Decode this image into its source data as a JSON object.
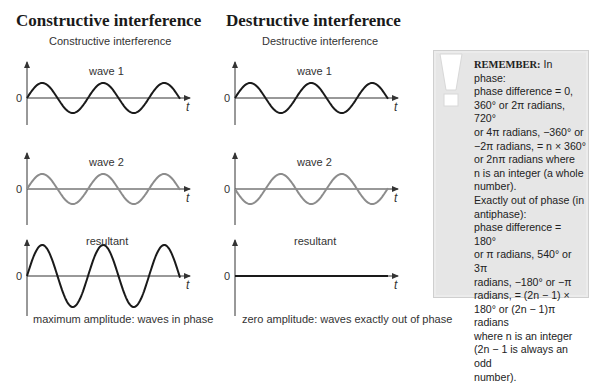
{
  "sections": {
    "constructive": {
      "heading": "Constructive interference",
      "subtitle": "Constructive interference",
      "panels": [
        {
          "label": "wave 1",
          "zero": "0",
          "axis": "t"
        },
        {
          "label": "wave 2",
          "zero": "0",
          "axis": "t"
        },
        {
          "label": "resultant",
          "zero": "0",
          "axis": "t"
        }
      ],
      "caption": "maximum amplitude: waves in phase"
    },
    "destructive": {
      "heading": "Destructive interference",
      "subtitle": "Destructive interference",
      "panels": [
        {
          "label": "wave 1",
          "zero": "0",
          "axis": "t"
        },
        {
          "label": "wave 2",
          "zero": "0",
          "axis": "t"
        },
        {
          "label": "resultant",
          "zero": "0",
          "axis": "t"
        }
      ],
      "caption": "zero amplitude: waves exactly out of phase"
    }
  },
  "remember_box": {
    "icon": "exclamation-icon",
    "title": "REMEMBER:",
    "lines": [
      " In phase:",
      "phase difference = 0,",
      "360° or 2π radians, 720°",
      "or 4π radians, −360° or",
      "−2π radians, = n × 360°",
      "or 2nπ radians where",
      "n is an integer (a whole",
      "number).",
      "Exactly out of phase (in",
      "antiphase):",
      "phase difference = 180°",
      "or π radians, 540° or 3π",
      "radians, −180° or −π",
      "radians, = (2n − 1) ×",
      "180° or (2n − 1)π radians",
      "where n is an integer",
      "(2n − 1 is always an odd",
      "number)."
    ]
  },
  "colors": {
    "wave_dark": "#1a1a1a",
    "wave_gray": "#8c8c8c",
    "box_bg": "#e6e6e6"
  }
}
